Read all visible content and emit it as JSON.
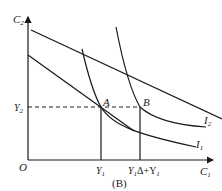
{
  "figure": {
    "caption": "(B)",
    "axes": {
      "x_label": "C",
      "x_label_sub": "1",
      "y_label": "C",
      "y_label_sub": "2",
      "origin_label": "O"
    },
    "points": {
      "A": "A",
      "B": "B"
    },
    "tick_labels": {
      "y2_main": "Y",
      "y2_sub": "2",
      "y1_main": "Y",
      "y1_sub": "1",
      "y1_delta_main": "Y",
      "y1_delta_sub": "1",
      "y1_delta_mid": "Δ+Y",
      "y1_delta_sub2": "1"
    },
    "curves": {
      "I1_main": "I",
      "I1_sub": "1",
      "I2_main": "I",
      "I2_sub": "2"
    },
    "colors": {
      "stroke": "#1a1a1a",
      "text": "#222222",
      "background": "#ffffff"
    }
  }
}
